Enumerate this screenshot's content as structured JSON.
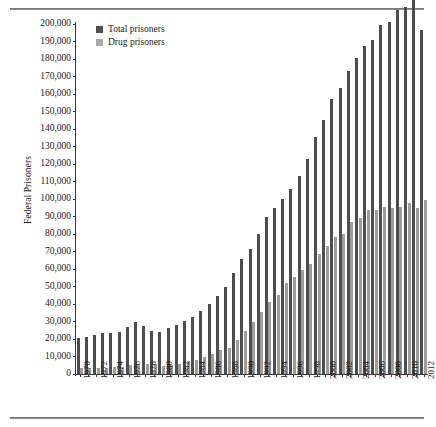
{
  "chart_data": {
    "type": "bar",
    "title": "",
    "xlabel": "",
    "ylabel": "Federal Prisoners",
    "ylim": [
      0,
      200000
    ],
    "ytick_step": 10000,
    "grid": false,
    "legend_position": "top-left",
    "x": [
      1970,
      1971,
      1972,
      1973,
      1974,
      1975,
      1976,
      1977,
      1978,
      1979,
      1980,
      1981,
      1982,
      1983,
      1984,
      1985,
      1986,
      1987,
      1988,
      1989,
      1990,
      1991,
      1992,
      1993,
      1994,
      1995,
      1996,
      1997,
      1998,
      1999,
      2000,
      2001,
      2002,
      2003,
      2004,
      2005,
      2006,
      2007,
      2008,
      2009,
      2010,
      2011,
      2012
    ],
    "xtick_labels": [
      "1970",
      "1972",
      "1974",
      "1976",
      "1978",
      "1980",
      "1982",
      "1984",
      "1986",
      "1988",
      "1990",
      "1992",
      "1994",
      "1996",
      "1998",
      "2000",
      "2002",
      "2004",
      "2006",
      "2008",
      "2010",
      "2012"
    ],
    "ytick_labels": [
      "0",
      "10,000",
      "20,000",
      "30,000",
      "40,000",
      "50,000",
      "60,000",
      "70,000",
      "80,000",
      "90,000",
      "100,000",
      "110,000",
      "120,000",
      "130,000",
      "140,000",
      "150,000",
      "160,000",
      "170,000",
      "180,000",
      "190,000",
      "200,000"
    ],
    "series": [
      {
        "name": "Total prisoners",
        "color": "#4d4d4d",
        "values": [
          20686,
          20891,
          22090,
          23336,
          23690,
          24131,
          27033,
          29877,
          27674,
          24810,
          24252,
          26195,
          28133,
          30214,
          32317,
          36042,
          39781,
          44408,
          49928,
          57662,
          65526,
          71608,
          80259,
          89587,
          95034,
          100250,
          105544,
          112973,
          123041,
          135246,
          145416,
          156993,
          163436,
          173059,
          180328,
          187618,
          191080,
          199618,
          201280,
          208118,
          209771,
          217815,
          196574
        ],
        "values_units": "prisoners"
      },
      {
        "name": "Drug prisoners",
        "color": "#9d9d9d",
        "values": [
          3384,
          3495,
          3523,
          3647,
          3955,
          4221,
          4926,
          5604,
          5981,
          5468,
          4749,
          5076,
          5518,
          7201,
          8152,
          9491,
          11344,
          13897,
          15087,
          19494,
          24297,
          29667,
          35398,
          41393,
          45367,
          51737,
          55194,
          59227,
          63011,
          68360,
          73389,
          78501,
          80272,
          86972,
          89269,
          93751,
          93751,
          95446,
          95079,
          95205,
          97472,
          94600,
          99426
        ],
        "values_units": "prisoners"
      }
    ]
  },
  "legend": {
    "items": [
      {
        "label": "Total prisoners",
        "swatch": "dark-gray-swatch"
      },
      {
        "label": "Drug prisoners",
        "swatch": "light-gray-swatch"
      }
    ]
  },
  "axes": {
    "y_title": "Federal Prisoners"
  }
}
